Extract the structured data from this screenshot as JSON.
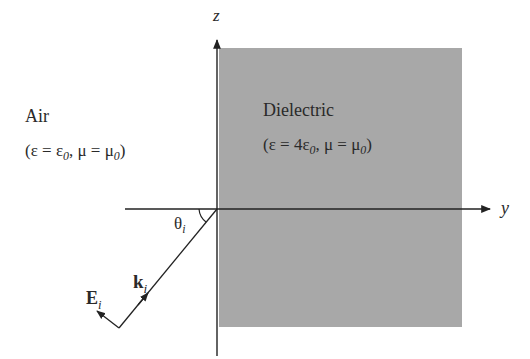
{
  "diagram": {
    "type": "oblique incidence at air-dielectric interface",
    "axes": {
      "vertical_label": "z",
      "horizontal_label": "y"
    },
    "region_left": {
      "name": "Air",
      "params": "(ε = ε0, μ = μ0)",
      "params_parts": {
        "open": "(ε = ε",
        "sub1": "0",
        "mid": ", μ = μ",
        "sub2": "0",
        "close": ")"
      }
    },
    "region_right": {
      "name": "Dielectric",
      "params": "(ε = 4ε0, μ = μ0)",
      "params_parts": {
        "open": "(ε = 4ε",
        "sub1": "0",
        "mid": ", μ = μ",
        "sub2": "0",
        "close": ")"
      },
      "fill_color": "#a8a8a8"
    },
    "incident_wave": {
      "k_label": "k",
      "k_sub": "i",
      "E_label": "E",
      "E_sub": "i",
      "angle_label": "θ",
      "angle_sub": "i"
    },
    "colors": {
      "line": "#222222",
      "dielectric": "#a8a8a8",
      "background": "#ffffff"
    }
  }
}
